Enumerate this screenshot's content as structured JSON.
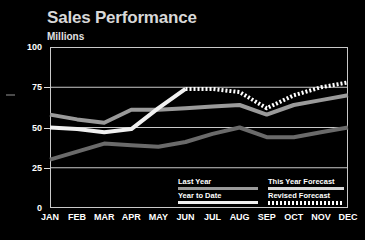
{
  "chart_data": {
    "type": "line",
    "title": "Sales Performance",
    "subtitle": "Millions",
    "xlabel": "",
    "ylabel": "Millions",
    "ylim": [
      0,
      100
    ],
    "yticks": [
      0,
      25,
      50,
      75,
      100
    ],
    "grid": true,
    "legend_position": "bottom-inside",
    "categories": [
      "JAN",
      "FEB",
      "MAR",
      "APR",
      "MAY",
      "JUN",
      "JUL",
      "AUG",
      "SEP",
      "OCT",
      "NOV",
      "DEC"
    ],
    "series": [
      {
        "name": "Last Year",
        "color": "#9a9a9a",
        "style": "solid",
        "values": [
          58,
          55,
          53,
          61,
          61,
          62,
          63,
          64,
          58,
          64,
          67,
          70
        ]
      },
      {
        "name": "Year to Date",
        "color": "#f0f0f0",
        "style": "solid",
        "values": [
          50,
          49,
          47,
          49,
          62,
          74,
          null,
          null,
          null,
          null,
          null,
          null
        ]
      },
      {
        "name": "This Year Forecast",
        "color": "#6a6a6a",
        "style": "solid",
        "values": [
          30,
          35,
          40,
          39,
          38,
          41,
          46,
          50,
          44,
          44,
          47,
          50
        ]
      },
      {
        "name": "Revised Forecast",
        "color": "#ffffff",
        "style": "dotted",
        "values": [
          null,
          null,
          null,
          null,
          null,
          74,
          74,
          72,
          62,
          70,
          75,
          78
        ]
      }
    ]
  },
  "legend": {
    "items": [
      {
        "label": "Last Year",
        "style": "solid",
        "color": "#9a9a9a"
      },
      {
        "label": "Year to Date",
        "style": "solid",
        "color": "#f0f0f0"
      },
      {
        "label": "This Year Forecast",
        "style": "solid",
        "color": "#d8d8d8"
      },
      {
        "label": "Revised Forecast",
        "style": "dotted",
        "color": "#ffffff"
      }
    ]
  },
  "colors": {
    "background": "#000000",
    "axis": "#c9c9c9",
    "grid": "#c9c9c9",
    "text": "#ffffff",
    "title": "#d8d8d8"
  }
}
